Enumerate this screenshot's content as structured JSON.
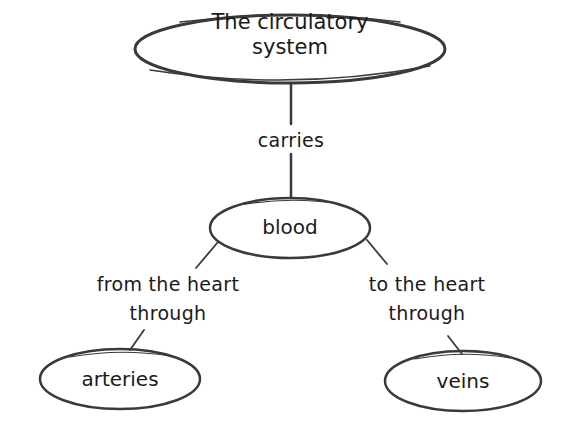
{
  "diagram": {
    "type": "concept-map",
    "stroke_color": "#3a3a3a",
    "nodes": {
      "root": {
        "line1": "The circulatory",
        "line2": "system"
      },
      "blood": {
        "label": "blood"
      },
      "arteries": {
        "label": "arteries"
      },
      "veins": {
        "label": "veins"
      }
    },
    "edges": {
      "carries": {
        "label": "carries"
      },
      "left": {
        "line1": "from the heart",
        "line2": "through"
      },
      "right": {
        "line1": "to the heart",
        "line2": "through"
      }
    }
  }
}
